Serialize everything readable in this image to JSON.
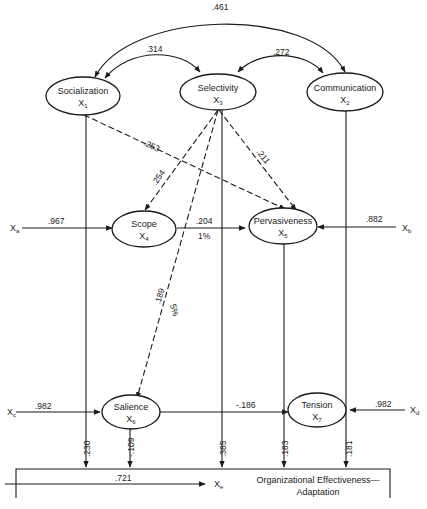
{
  "nodes": {
    "socialization": {
      "name": "Socialization",
      "var": "X",
      "sub": "1"
    },
    "selectivity": {
      "name": "Selectivity",
      "var": "X",
      "sub": "3"
    },
    "communication": {
      "name": "Communication",
      "var": "X",
      "sub": "2"
    },
    "scope": {
      "name": "Scope",
      "var": "X",
      "sub": "4"
    },
    "pervasiveness": {
      "name": "Pervasiveness",
      "var": "X",
      "sub": "5"
    },
    "salience": {
      "name": "Salience",
      "var": "X",
      "sub": "6"
    },
    "tension": {
      "name": "Tension",
      "var": "X",
      "sub": "7"
    },
    "outcome": {
      "name_line1": "Organizational Effectiveness—",
      "name_line2": "Adaptation"
    }
  },
  "residuals": {
    "scope": {
      "label": "X",
      "sub": "a",
      "coef": ".967"
    },
    "pervasiveness": {
      "label": "X",
      "sub": "b",
      "coef": ".882"
    },
    "salience": {
      "label": "X",
      "sub": "c",
      "coef": ".982"
    },
    "tension": {
      "label": "X",
      "sub": "d",
      "coef": ".982"
    },
    "outcome": {
      "label": "X",
      "sub": "e",
      "coef": ".721"
    }
  },
  "correlations": {
    "soc_comm": ".461",
    "soc_sel": ".314",
    "sel_comm": ".272"
  },
  "paths": {
    "soc_perv": ".253",
    "sel_perv": ".211",
    "sel_scope": ".254",
    "sel_salience": ".189",
    "sel_salience_sig": "5%",
    "scope_perv": ".204",
    "scope_perv_sig": "1%",
    "salience_tension": "-.186",
    "soc_outcome": ".230",
    "salience_outcome": "-.109",
    "sel_outcome": ".385",
    "perv_outcome": ".183",
    "comm_outcome": ".181"
  }
}
